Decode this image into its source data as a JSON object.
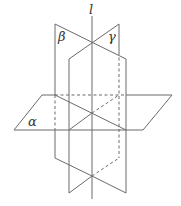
{
  "diagram": {
    "type": "intersecting-planes",
    "labels": {
      "line": "l",
      "plane_beta": "β",
      "plane_gamma": "γ",
      "plane_alpha": "α"
    },
    "colors": {
      "stroke": "#6a6a6a",
      "text": "#333333",
      "background": "#ffffff"
    }
  }
}
